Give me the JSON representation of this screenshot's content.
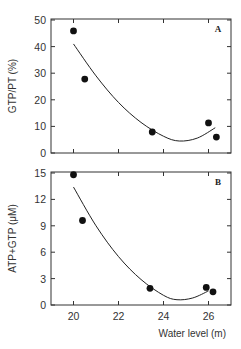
{
  "chart_data": [
    {
      "type": "scatter",
      "panel": "A",
      "title": "",
      "xlabel": "Water level (m)",
      "ylabel": "GTP/PT (%)",
      "xlim": [
        19,
        27
      ],
      "ylim": [
        0,
        50
      ],
      "xticks": [
        20,
        22,
        24,
        26
      ],
      "yticks": [
        0,
        10,
        20,
        30,
        40,
        50
      ],
      "grid": false,
      "legend": null,
      "annotations": [
        "A"
      ],
      "series": [
        {
          "name": "observed",
          "marker": "filled-circle",
          "x": [
            20.0,
            20.5,
            23.5,
            26.0,
            26.35
          ],
          "y": [
            45.9,
            27.8,
            7.9,
            11.3,
            6.0
          ]
        },
        {
          "name": "quadratic fit",
          "style": "line",
          "x": [
            20.0,
            21.0,
            22.0,
            23.0,
            24.0,
            24.7,
            25.5,
            26.3
          ],
          "y": [
            41.0,
            29.0,
            19.0,
            11.5,
            6.3,
            4.5,
            5.6,
            9.5
          ]
        }
      ]
    },
    {
      "type": "scatter",
      "panel": "B",
      "title": "",
      "xlabel": "Water level (m)",
      "ylabel": "ATP+GTP (μM)",
      "xlim": [
        19,
        27
      ],
      "ylim": [
        0,
        16
      ],
      "xticks": [
        20,
        22,
        24,
        26
      ],
      "yticks": [
        0,
        3,
        6,
        9,
        12,
        15
      ],
      "grid": false,
      "legend": null,
      "annotations": [
        "B"
      ],
      "series": [
        {
          "name": "observed",
          "marker": "filled-circle",
          "x": [
            20.0,
            20.4,
            23.4,
            25.9,
            26.2
          ],
          "y": [
            14.8,
            9.6,
            1.9,
            2.0,
            1.5
          ]
        },
        {
          "name": "quadratic fit",
          "style": "line",
          "x": [
            20.0,
            21.0,
            22.0,
            23.0,
            24.0,
            24.6,
            25.3,
            26.0
          ],
          "y": [
            13.4,
            9.0,
            5.5,
            2.9,
            1.1,
            0.6,
            0.8,
            1.6
          ]
        }
      ]
    }
  ],
  "labels": {
    "panel_a_tag": "A",
    "panel_b_tag": "B",
    "panel_a_ylabel": "GTP/PT (%)",
    "panel_b_ylabel": "ATP+GTP (μM)",
    "xlabel": "Water level (m)"
  }
}
